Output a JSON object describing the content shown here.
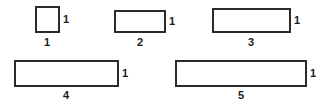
{
  "figure": {
    "background_color": "#ffffff",
    "stroke_color": "#2b2b2b",
    "label_color": "#1a1a1a",
    "unit_px": 26,
    "shapes": [
      {
        "name": "rectangle-1",
        "x": 35,
        "y": 6,
        "width": 25,
        "height": 27,
        "width_label": "1",
        "height_label": "1",
        "width_label_x": 47,
        "width_label_y": 37,
        "height_label_x": 63,
        "height_label_y": 19
      },
      {
        "name": "rectangle-2",
        "x": 114,
        "y": 10,
        "width": 52,
        "height": 23,
        "width_label": "2",
        "height_label": "1",
        "width_label_x": 140,
        "width_label_y": 37,
        "height_label_x": 169,
        "height_label_y": 21
      },
      {
        "name": "rectangle-3",
        "x": 212,
        "y": 8,
        "width": 79,
        "height": 25,
        "width_label": "3",
        "height_label": "1",
        "width_label_x": 251,
        "width_label_y": 37,
        "height_label_x": 294,
        "height_label_y": 20
      },
      {
        "name": "rectangle-4",
        "x": 14,
        "y": 60,
        "width": 105,
        "height": 27,
        "width_label": "4",
        "height_label": "1",
        "width_label_x": 66,
        "width_label_y": 90,
        "height_label_x": 122,
        "height_label_y": 73
      },
      {
        "name": "rectangle-5",
        "x": 175,
        "y": 60,
        "width": 132,
        "height": 27,
        "width_label": "5",
        "height_label": "1",
        "width_label_x": 241,
        "width_label_y": 90,
        "height_label_x": 310,
        "height_label_y": 73
      }
    ]
  }
}
